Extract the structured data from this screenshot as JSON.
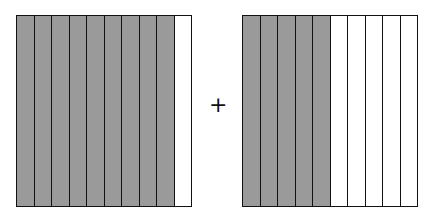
{
  "diagram": {
    "operator": "+",
    "shade_color": "#9a9a9a",
    "models": [
      {
        "name": "left-model",
        "total_parts": 10,
        "shaded_parts": 9,
        "left": 16
      },
      {
        "name": "right-model",
        "total_parts": 10,
        "shaded_parts": 5,
        "left": 242
      }
    ]
  }
}
